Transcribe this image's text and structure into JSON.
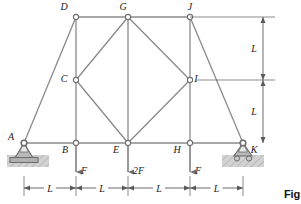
{
  "figure": {
    "caption": "Fig",
    "colors": {
      "member": "#8a8a8a",
      "joint_fill": "#ffffff",
      "joint_stroke": "#6f6f6f",
      "dimension": "#5a5a5a",
      "support_fill": "#b9b9b9",
      "support_stroke": "#6b6b6b",
      "ground_fill": "#cfcfcf",
      "label": "#1a1a1a",
      "force": "#6e6e6e"
    }
  },
  "joints": [
    {
      "id": "A",
      "label": "A",
      "x": 24,
      "y": 143,
      "label_dx": -13,
      "label_dy": -3
    },
    {
      "id": "B",
      "label": "B",
      "x": 76,
      "y": 143,
      "label_dx": -11,
      "label_dy": 10
    },
    {
      "id": "C",
      "label": "C",
      "x": 76,
      "y": 80,
      "label_dx": -12,
      "label_dy": 2
    },
    {
      "id": "D",
      "label": "D",
      "x": 76,
      "y": 17,
      "label_dx": -12,
      "label_dy": -7
    },
    {
      "id": "E",
      "label": "E",
      "x": 128,
      "y": 143,
      "label_dx": -12,
      "label_dy": 10
    },
    {
      "id": "G",
      "label": "G",
      "x": 128,
      "y": 17,
      "label_dx": -5,
      "label_dy": -7
    },
    {
      "id": "H",
      "label": "H",
      "x": 190,
      "y": 143,
      "label_dx": -13,
      "label_dy": 10
    },
    {
      "id": "I",
      "label": "I",
      "x": 190,
      "y": 80,
      "label_dx": 6,
      "label_dy": 2
    },
    {
      "id": "J",
      "label": "J",
      "x": 190,
      "y": 17,
      "label_dx": 0,
      "label_dy": -7
    },
    {
      "id": "K",
      "label": "K",
      "x": 243,
      "y": 143,
      "label_dx": 11,
      "label_dy": 10
    }
  ],
  "members": [
    {
      "from": "A",
      "to": "D"
    },
    {
      "from": "A",
      "to": "B"
    },
    {
      "from": "B",
      "to": "E"
    },
    {
      "from": "E",
      "to": "H"
    },
    {
      "from": "H",
      "to": "K"
    },
    {
      "from": "D",
      "to": "G"
    },
    {
      "from": "G",
      "to": "J"
    },
    {
      "from": "D",
      "to": "B"
    },
    {
      "from": "G",
      "to": "E"
    },
    {
      "from": "J",
      "to": "H"
    },
    {
      "from": "C",
      "to": "G"
    },
    {
      "from": "G",
      "to": "I"
    },
    {
      "from": "I",
      "to": "E"
    },
    {
      "from": "E",
      "to": "C"
    },
    {
      "from": "J",
      "to": "K"
    }
  ],
  "loads": [
    {
      "at": "B",
      "label": "F",
      "x": 76,
      "y_start": 146,
      "y_end": 172,
      "label_dx": 5,
      "label_dy": 2
    },
    {
      "at": "E",
      "label": "2F",
      "x": 128,
      "y_start": 146,
      "y_end": 172,
      "label_dx": 5,
      "label_dy": 2
    },
    {
      "at": "H",
      "label": "F",
      "x": 190,
      "y_start": 146,
      "y_end": 172,
      "label_dx": 5,
      "label_dy": 2
    }
  ],
  "supports": [
    {
      "at": "A",
      "type": "pin",
      "name": "pin-support"
    },
    {
      "at": "K",
      "type": "roller",
      "name": "roller-support"
    }
  ],
  "horizontal_dimensions": [
    {
      "label": "L",
      "x_start": 24,
      "x_end": 76,
      "y": 188
    },
    {
      "label": "L",
      "x_start": 76,
      "x_end": 128,
      "y": 188
    },
    {
      "label": "L",
      "x_start": 128,
      "x_end": 190,
      "y": 188
    },
    {
      "label": "L",
      "x_start": 190,
      "x_end": 243,
      "y": 188
    }
  ],
  "vertical_dimensions": [
    {
      "label": "L",
      "x": 263,
      "y_start": 17,
      "y_end": 80,
      "label_dx": -9
    },
    {
      "label": "L",
      "x": 263,
      "y_start": 80,
      "y_end": 143,
      "label_dx": -9
    }
  ],
  "extension_lines": [
    {
      "x_start": 190,
      "x_end": 275,
      "y": 17
    },
    {
      "x_start": 196,
      "x_end": 275,
      "y": 80
    },
    {
      "x_start": 24,
      "x_end": 60,
      "y": 188,
      "type": "vertical_tick_left"
    }
  ]
}
